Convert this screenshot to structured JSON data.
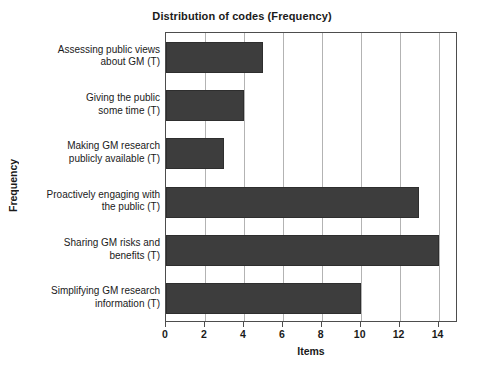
{
  "chart_data": {
    "type": "bar",
    "orientation": "horizontal",
    "title": "Distribution of codes (Frequency)",
    "xlabel": "Items",
    "ylabel": "Frequency",
    "categories": [
      "Assessing public views about GM (T)",
      "Giving the public some time (T)",
      "Making GM research publicly available (T)",
      "Proactively engaging with the public (T)",
      "Sharing GM risks and benefits (T)",
      "Simplifying GM research information (T)"
    ],
    "category_lines": [
      [
        "Assessing public views",
        "about GM (T)"
      ],
      [
        "Giving the public",
        "some time (T)"
      ],
      [
        "Making GM research",
        "publicly available (T)"
      ],
      [
        "Proactively engaging with",
        "the public (T)"
      ],
      [
        "Sharing GM risks and",
        "benefits (T)"
      ],
      [
        "Simplifying GM research",
        "information (T)"
      ]
    ],
    "values": [
      5,
      4,
      3,
      13,
      14,
      10
    ],
    "xlim": [
      0,
      15
    ],
    "xticks": [
      0,
      2,
      4,
      6,
      8,
      10,
      12,
      14
    ],
    "xtick_labels": [
      "0",
      "2",
      "4",
      "6",
      "8",
      "10",
      "12",
      "14"
    ],
    "grid": "vertical",
    "legend": "none",
    "bar_color": "#3d3d3d",
    "grid_color": "#b3b3b3",
    "frame_color": "#4d4d4d",
    "background_color": "#ffffff"
  }
}
